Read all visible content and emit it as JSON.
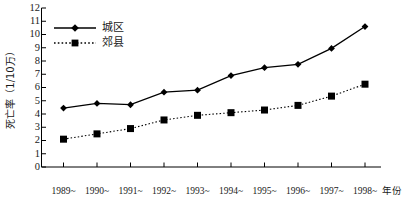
{
  "chart_data": {
    "type": "line",
    "title": "",
    "xlabel": "年份",
    "ylabel": "死亡率（1/10万）",
    "categories": [
      "1989~",
      "1990~",
      "1991~",
      "1992~",
      "1993~",
      "1994~",
      "1995~",
      "1996~",
      "1997~",
      "1998~"
    ],
    "ylim": [
      0,
      12
    ],
    "yticks": [
      0,
      1,
      2,
      3,
      4,
      5,
      6,
      7,
      8,
      9,
      10,
      11,
      12
    ],
    "ytick_labels": [
      "0",
      "1",
      "2",
      "3",
      "4",
      "5",
      "6",
      "7",
      "8",
      "9",
      "10",
      "11",
      "12"
    ],
    "grid": false,
    "legend_position": "upper-left",
    "series": [
      {
        "name": "城区",
        "marker": "diamond",
        "line_style": "solid",
        "color": "#000000",
        "values": [
          4.45,
          4.8,
          4.7,
          5.65,
          5.8,
          6.9,
          7.5,
          7.75,
          8.95,
          10.6
        ]
      },
      {
        "name": "郊县",
        "marker": "square",
        "line_style": "dotted",
        "color": "#000000",
        "values": [
          2.1,
          2.5,
          2.9,
          3.55,
          3.9,
          4.1,
          4.3,
          4.65,
          5.35,
          6.25
        ]
      }
    ]
  },
  "axes": {
    "y_title": "死亡率（1/10万）",
    "x_title": "年份"
  },
  "legend": {
    "items": [
      {
        "label": "城区"
      },
      {
        "label": "郊县"
      }
    ]
  }
}
